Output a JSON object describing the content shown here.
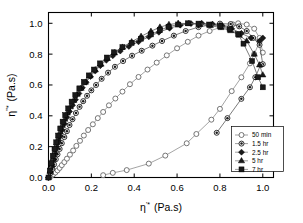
{
  "figure": {
    "type": "cole-cole-plot",
    "background": "#ffffff"
  },
  "axes": {
    "xlabel_main": "η",
    "xlabel_sup": "'*",
    "xlabel_units": "(Pa.s)",
    "ylabel_main": "η",
    "ylabel_sup": "''*",
    "ylabel_units": "(Pa.s)",
    "xticks": [
      "0.0",
      "0.2",
      "0.4",
      "0.6",
      "0.8",
      "1.0"
    ],
    "yticks": [
      "0.0",
      "0.2",
      "0.4",
      "0.6",
      "0.8",
      "1.0"
    ],
    "xlim": [
      0.0,
      1.05
    ],
    "ylim": [
      0.0,
      1.07
    ]
  },
  "legend": {
    "position": "lower-right",
    "entries": [
      {
        "label": "50 min",
        "marker": "open-circle",
        "color": "#ffffff",
        "edge": "#555555"
      },
      {
        "label": "1.5 hr",
        "marker": "half-filled-circle",
        "color": "#808080",
        "edge": "#000000"
      },
      {
        "label": "2.5 hr",
        "marker": "filled-diamond",
        "color": "#1a1a1a",
        "edge": "#000000"
      },
      {
        "label": "5 hr",
        "marker": "filled-triangle",
        "color": "#1a1a1a",
        "edge": "#000000"
      },
      {
        "label": "7 hr",
        "marker": "filled-square",
        "color": "#1a1a1a",
        "edge": "#000000"
      }
    ]
  },
  "chart_data": {
    "type": "scatter",
    "title": "",
    "xlabel": "η'* (Pa.s)",
    "ylabel": "η''* (Pa.s)",
    "xlim": [
      0.0,
      1.05
    ],
    "ylim": [
      0.0,
      1.07
    ],
    "grid": false,
    "legend_position": "lower-right",
    "series": [
      {
        "name": "50 min",
        "marker": "open-circle",
        "points": [
          [
            0.0,
            0.0
          ],
          [
            0.012,
            0.01
          ],
          [
            0.022,
            0.02
          ],
          [
            0.032,
            0.032
          ],
          [
            0.042,
            0.046
          ],
          [
            0.052,
            0.062
          ],
          [
            0.062,
            0.08
          ],
          [
            0.074,
            0.1
          ],
          [
            0.086,
            0.122
          ],
          [
            0.1,
            0.148
          ],
          [
            0.115,
            0.175
          ],
          [
            0.13,
            0.205
          ],
          [
            0.147,
            0.238
          ],
          [
            0.165,
            0.272
          ],
          [
            0.185,
            0.308
          ],
          [
            0.207,
            0.345
          ],
          [
            0.23,
            0.385
          ],
          [
            0.255,
            0.425
          ],
          [
            0.282,
            0.468
          ],
          [
            0.312,
            0.512
          ],
          [
            0.345,
            0.557
          ],
          [
            0.38,
            0.605
          ],
          [
            0.42,
            0.652
          ],
          [
            0.462,
            0.7
          ],
          [
            0.505,
            0.745
          ],
          [
            0.552,
            0.792
          ],
          [
            0.6,
            0.838
          ],
          [
            0.65,
            0.88
          ],
          [
            0.7,
            0.92
          ],
          [
            0.752,
            0.95
          ],
          [
            0.805,
            0.975
          ],
          [
            0.86,
            0.993
          ],
          [
            0.885,
            1.0
          ],
          [
            0.925,
            0.992
          ],
          [
            0.96,
            0.965
          ],
          [
            0.985,
            0.905
          ],
          [
            1.0,
            0.81
          ]
        ]
      },
      {
        "name": "50 min lower branch",
        "marker": "open-circle",
        "points": [
          [
            0.255,
            0.015
          ],
          [
            0.3,
            0.03
          ],
          [
            0.365,
            0.048
          ],
          [
            0.468,
            0.09
          ],
          [
            0.545,
            0.142
          ],
          [
            0.645,
            0.222
          ],
          [
            0.69,
            0.282
          ],
          [
            0.76,
            0.375
          ],
          [
            0.8,
            0.445
          ],
          [
            0.855,
            0.56
          ],
          [
            0.9,
            0.65
          ],
          [
            0.94,
            0.74
          ],
          [
            0.96,
            0.8
          ],
          [
            0.985,
            0.88
          ]
        ]
      },
      {
        "name": "1.5 hr",
        "marker": "half-filled-circle",
        "points": [
          [
            0.0,
            0.0
          ],
          [
            0.01,
            0.028
          ],
          [
            0.018,
            0.055
          ],
          [
            0.026,
            0.085
          ],
          [
            0.034,
            0.118
          ],
          [
            0.042,
            0.15
          ],
          [
            0.052,
            0.185
          ],
          [
            0.062,
            0.222
          ],
          [
            0.074,
            0.262
          ],
          [
            0.086,
            0.3
          ],
          [
            0.098,
            0.34
          ],
          [
            0.112,
            0.378
          ],
          [
            0.128,
            0.418
          ],
          [
            0.145,
            0.458
          ],
          [
            0.162,
            0.495
          ],
          [
            0.18,
            0.53
          ],
          [
            0.2,
            0.565
          ],
          [
            0.222,
            0.6
          ],
          [
            0.248,
            0.64
          ],
          [
            0.278,
            0.68
          ],
          [
            0.31,
            0.718
          ],
          [
            0.348,
            0.755
          ],
          [
            0.39,
            0.79
          ],
          [
            0.435,
            0.822
          ],
          [
            0.485,
            0.855
          ],
          [
            0.53,
            0.885
          ],
          [
            0.585,
            0.92
          ],
          [
            0.64,
            0.95
          ],
          [
            0.7,
            0.975
          ],
          [
            0.755,
            0.99
          ],
          [
            0.8,
            0.998
          ],
          [
            0.85,
            0.995
          ],
          [
            0.89,
            0.98
          ],
          [
            0.925,
            0.95
          ],
          [
            0.955,
            0.905
          ],
          [
            0.985,
            0.86
          ],
          [
            1.0,
            0.735
          ]
        ]
      },
      {
        "name": "1.5 hr descending",
        "marker": "half-filled-circle",
        "points": [
          [
            0.785,
            0.29
          ],
          [
            0.835,
            0.385
          ],
          [
            0.9,
            0.51
          ],
          [
            0.94,
            0.585
          ],
          [
            0.965,
            0.65
          ],
          [
            0.99,
            0.73
          ]
        ]
      },
      {
        "name": "2.5 hr",
        "marker": "filled-diamond",
        "points": [
          [
            0.0,
            0.0
          ],
          [
            0.008,
            0.035
          ],
          [
            0.015,
            0.072
          ],
          [
            0.022,
            0.11
          ],
          [
            0.03,
            0.15
          ],
          [
            0.038,
            0.19
          ],
          [
            0.046,
            0.228
          ],
          [
            0.055,
            0.268
          ],
          [
            0.064,
            0.308
          ],
          [
            0.074,
            0.348
          ],
          [
            0.086,
            0.39
          ],
          [
            0.098,
            0.428
          ],
          [
            0.112,
            0.468
          ],
          [
            0.126,
            0.505
          ],
          [
            0.142,
            0.545
          ],
          [
            0.158,
            0.582
          ],
          [
            0.176,
            0.618
          ],
          [
            0.196,
            0.655
          ],
          [
            0.218,
            0.69
          ],
          [
            0.242,
            0.725
          ],
          [
            0.27,
            0.76
          ],
          [
            0.3,
            0.79
          ],
          [
            0.335,
            0.82
          ],
          [
            0.375,
            0.85
          ],
          [
            0.42,
            0.88
          ],
          [
            0.468,
            0.912
          ],
          [
            0.515,
            0.942
          ],
          [
            0.565,
            0.968
          ],
          [
            0.615,
            0.988
          ],
          [
            0.665,
            0.998
          ],
          [
            0.715,
            1.0
          ],
          [
            0.765,
            0.995
          ],
          [
            0.81,
            0.985
          ],
          [
            0.855,
            0.965
          ],
          [
            0.9,
            0.935
          ],
          [
            0.945,
            0.905
          ],
          [
            0.985,
            0.885
          ],
          [
            1.0,
            0.905
          ]
        ]
      },
      {
        "name": "5 hr",
        "marker": "filled-triangle",
        "points": [
          [
            0.0,
            0.0
          ],
          [
            0.007,
            0.04
          ],
          [
            0.014,
            0.082
          ],
          [
            0.021,
            0.125
          ],
          [
            0.029,
            0.168
          ],
          [
            0.037,
            0.21
          ],
          [
            0.046,
            0.252
          ],
          [
            0.055,
            0.295
          ],
          [
            0.065,
            0.338
          ],
          [
            0.076,
            0.378
          ],
          [
            0.088,
            0.418
          ],
          [
            0.102,
            0.458
          ],
          [
            0.118,
            0.5
          ],
          [
            0.134,
            0.54
          ],
          [
            0.152,
            0.578
          ],
          [
            0.172,
            0.618
          ],
          [
            0.194,
            0.658
          ],
          [
            0.218,
            0.698
          ],
          [
            0.245,
            0.735
          ],
          [
            0.275,
            0.772
          ],
          [
            0.308,
            0.808
          ],
          [
            0.345,
            0.845
          ],
          [
            0.388,
            0.88
          ],
          [
            0.432,
            0.915
          ],
          [
            0.478,
            0.948
          ],
          [
            0.52,
            0.975
          ],
          [
            0.562,
            0.992
          ],
          [
            0.605,
            1.0
          ],
          [
            0.655,
            0.998
          ],
          [
            0.705,
            0.992
          ],
          [
            0.755,
            0.985
          ],
          [
            0.805,
            0.972
          ],
          [
            0.85,
            0.952
          ],
          [
            0.89,
            0.922
          ],
          [
            0.925,
            0.885
          ],
          [
            0.96,
            0.8
          ],
          [
            0.985,
            0.73
          ],
          [
            1.0,
            0.665
          ]
        ]
      },
      {
        "name": "7 hr",
        "marker": "filled-square",
        "points": [
          [
            0.0,
            0.0
          ],
          [
            0.006,
            0.045
          ],
          [
            0.013,
            0.092
          ],
          [
            0.02,
            0.14
          ],
          [
            0.028,
            0.185
          ],
          [
            0.036,
            0.228
          ],
          [
            0.045,
            0.272
          ],
          [
            0.055,
            0.318
          ],
          [
            0.066,
            0.362
          ],
          [
            0.078,
            0.405
          ],
          [
            0.092,
            0.448
          ],
          [
            0.108,
            0.492
          ],
          [
            0.125,
            0.535
          ],
          [
            0.144,
            0.578
          ],
          [
            0.165,
            0.62
          ],
          [
            0.188,
            0.662
          ],
          [
            0.212,
            0.7
          ],
          [
            0.24,
            0.74
          ],
          [
            0.272,
            0.778
          ],
          [
            0.305,
            0.812
          ],
          [
            0.345,
            0.845
          ],
          [
            0.388,
            0.872
          ],
          [
            0.432,
            0.9
          ],
          [
            0.478,
            0.928
          ],
          [
            0.52,
            0.955
          ],
          [
            0.56,
            0.978
          ],
          [
            0.605,
            0.992
          ],
          [
            0.65,
            1.0
          ],
          [
            0.7,
            0.998
          ],
          [
            0.75,
            0.992
          ],
          [
            0.8,
            0.982
          ],
          [
            0.845,
            0.962
          ],
          [
            0.885,
            0.93
          ],
          [
            0.91,
            0.868
          ],
          [
            0.95,
            0.755
          ],
          [
            0.978,
            0.65
          ],
          [
            1.0,
            0.585
          ]
        ]
      }
    ]
  }
}
